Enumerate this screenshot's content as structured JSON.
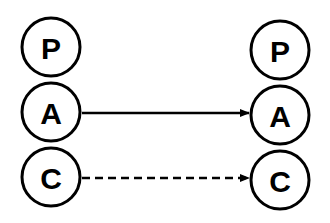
{
  "diagram": {
    "left_column": {
      "nodes": [
        {
          "label": "P",
          "cx": 51,
          "cy": 47
        },
        {
          "label": "A",
          "cx": 51,
          "cy": 112
        },
        {
          "label": "C",
          "cx": 51,
          "cy": 177
        }
      ]
    },
    "right_column": {
      "nodes": [
        {
          "label": "P",
          "cx": 280,
          "cy": 50
        },
        {
          "label": "A",
          "cx": 280,
          "cy": 115
        },
        {
          "label": "C",
          "cx": 280,
          "cy": 180
        }
      ]
    },
    "edges": [
      {
        "from": "left.A",
        "to": "right.A",
        "style": "solid"
      },
      {
        "from": "left.C",
        "to": "right.C",
        "style": "dashed"
      }
    ],
    "colors": {
      "stroke": "#000000",
      "fill": "#ffffff"
    }
  }
}
